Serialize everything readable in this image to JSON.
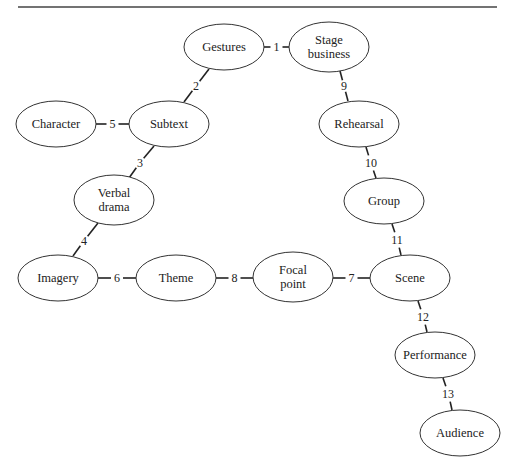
{
  "diagram": {
    "type": "concept-map",
    "nodes": [
      {
        "id": "gestures",
        "label": [
          "Gestures"
        ],
        "cx": 224,
        "cy": 47,
        "rx": 40,
        "ry": 23
      },
      {
        "id": "stage-business",
        "label": [
          "Stage",
          "business"
        ],
        "cx": 329,
        "cy": 47,
        "rx": 40,
        "ry": 25
      },
      {
        "id": "character",
        "label": [
          "Character"
        ],
        "cx": 56,
        "cy": 124,
        "rx": 40,
        "ry": 23
      },
      {
        "id": "subtext",
        "label": [
          "Subtext"
        ],
        "cx": 169,
        "cy": 124,
        "rx": 40,
        "ry": 23
      },
      {
        "id": "rehearsal",
        "label": [
          "Rehearsal"
        ],
        "cx": 359,
        "cy": 124,
        "rx": 40,
        "ry": 23
      },
      {
        "id": "verbal-drama",
        "label": [
          "Verbal",
          "drama"
        ],
        "cx": 114,
        "cy": 200,
        "rx": 40,
        "ry": 25
      },
      {
        "id": "group",
        "label": [
          "Group"
        ],
        "cx": 384,
        "cy": 201,
        "rx": 40,
        "ry": 23
      },
      {
        "id": "imagery",
        "label": [
          "Imagery"
        ],
        "cx": 58,
        "cy": 278,
        "rx": 40,
        "ry": 23
      },
      {
        "id": "theme",
        "label": [
          "Theme"
        ],
        "cx": 176,
        "cy": 278,
        "rx": 40,
        "ry": 23
      },
      {
        "id": "focal-point",
        "label": [
          "Focal",
          "point"
        ],
        "cx": 293,
        "cy": 277,
        "rx": 40,
        "ry": 25
      },
      {
        "id": "scene",
        "label": [
          "Scene"
        ],
        "cx": 410,
        "cy": 278,
        "rx": 40,
        "ry": 23
      },
      {
        "id": "performance",
        "label": [
          "Performance"
        ],
        "cx": 435,
        "cy": 355,
        "rx": 40,
        "ry": 23
      },
      {
        "id": "audience",
        "label": [
          "Audience"
        ],
        "cx": 460,
        "cy": 433,
        "rx": 40,
        "ry": 23
      }
    ],
    "edges": [
      {
        "label": "1",
        "from": "gestures",
        "to": "stage-business",
        "x1": 264,
        "y1": 47,
        "x2": 289,
        "y2": 47,
        "lx": 276.5,
        "ly": 47
      },
      {
        "label": "2",
        "from": "gestures",
        "to": "subtext",
        "x1": 209,
        "y1": 69,
        "x2": 184,
        "y2": 102,
        "lx": 196,
        "ly": 86
      },
      {
        "label": "3",
        "from": "subtext",
        "to": "verbal-drama",
        "x1": 154,
        "y1": 146,
        "x2": 129,
        "y2": 178,
        "lx": 140,
        "ly": 163
      },
      {
        "label": "4",
        "from": "verbal-drama",
        "to": "imagery",
        "x1": 98,
        "y1": 223,
        "x2": 73,
        "y2": 256,
        "lx": 84,
        "ly": 241
      },
      {
        "label": "5",
        "from": "character",
        "to": "subtext",
        "x1": 96,
        "y1": 124,
        "x2": 129,
        "y2": 124,
        "lx": 112.5,
        "ly": 124
      },
      {
        "label": "6",
        "from": "imagery",
        "to": "theme",
        "x1": 98,
        "y1": 278,
        "x2": 136,
        "y2": 278,
        "lx": 117,
        "ly": 278
      },
      {
        "label": "7",
        "from": "focal-point",
        "to": "scene",
        "x1": 333,
        "y1": 278,
        "x2": 370,
        "y2": 278,
        "lx": 351.5,
        "ly": 278
      },
      {
        "label": "8",
        "from": "theme",
        "to": "focal-point",
        "x1": 216,
        "y1": 278,
        "x2": 253,
        "y2": 278,
        "lx": 234.5,
        "ly": 278
      },
      {
        "label": "9",
        "from": "stage-business",
        "to": "rehearsal",
        "x1": 340,
        "y1": 71,
        "x2": 348,
        "y2": 101,
        "lx": 344,
        "ly": 86
      },
      {
        "label": "10",
        "from": "rehearsal",
        "to": "group",
        "x1": 366,
        "y1": 147,
        "x2": 376,
        "y2": 178,
        "lx": 371,
        "ly": 163
      },
      {
        "label": "11",
        "from": "group",
        "to": "scene",
        "x1": 392,
        "y1": 224,
        "x2": 401,
        "y2": 255,
        "lx": 397,
        "ly": 240
      },
      {
        "label": "12",
        "from": "scene",
        "to": "performance",
        "x1": 418,
        "y1": 301,
        "x2": 427,
        "y2": 332,
        "lx": 423,
        "ly": 317
      },
      {
        "label": "13",
        "from": "performance",
        "to": "audience",
        "x1": 443,
        "y1": 378,
        "x2": 452,
        "y2": 410,
        "lx": 448,
        "ly": 394
      }
    ],
    "rule": {
      "x1": 18,
      "y1": 7,
      "x2": 497,
      "y2": 7
    }
  }
}
